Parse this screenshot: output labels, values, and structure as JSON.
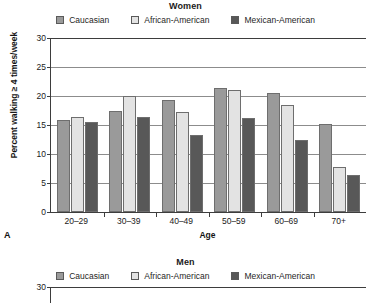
{
  "figure": {
    "panels": [
      {
        "letter": "A",
        "title": "Women",
        "visible": "full"
      },
      {
        "letter": "",
        "title": "Men",
        "visible": "cropped"
      }
    ]
  },
  "legend": {
    "items": [
      {
        "label": "Caucasian",
        "color": "#9a9a9a"
      },
      {
        "label": "African-American",
        "color": "#e3e3e3"
      },
      {
        "label": "Mexican-American",
        "color": "#585858"
      }
    ]
  },
  "axes": {
    "ylabel": "Percent walking ≥ 4 times/week",
    "xlabel": "Age",
    "yticks": [
      "0",
      "5",
      "10",
      "15",
      "20",
      "25",
      "30"
    ]
  },
  "chart_data": [
    {
      "type": "bar",
      "title": "Women",
      "panel_letter": "A",
      "xlabel": "Age",
      "ylabel": "Percent walking ≥ 4 times/week",
      "categories": [
        "20–29",
        "30–39",
        "40–49",
        "50–59",
        "60–69",
        "70+"
      ],
      "ylim": [
        0,
        30
      ],
      "ytick_step": 5,
      "grid": true,
      "legend_position": "top",
      "series": [
        {
          "name": "Caucasian",
          "color": "#9a9a9a",
          "values": [
            15.8,
            17.4,
            19.3,
            21.3,
            20.6,
            15.2
          ]
        },
        {
          "name": "African-American",
          "color": "#e3e3e3",
          "values": [
            16.4,
            20.0,
            17.3,
            21.0,
            18.4,
            7.7
          ]
        },
        {
          "name": "Mexican-American",
          "color": "#585858",
          "values": [
            15.5,
            16.3,
            13.3,
            16.2,
            12.4,
            6.3
          ]
        }
      ]
    },
    {
      "type": "bar",
      "title": "Men",
      "panel_letter": "B",
      "xlabel": "Age",
      "ylabel": "Percent walking ≥ 4 times/week",
      "categories": [],
      "ylim": [
        0,
        30
      ],
      "ytick_step": 5,
      "grid": true,
      "legend_position": "top",
      "note": "Panel cropped at bottom of image; only title, legend and the 30 tick of the y-axis are visible.",
      "series": [
        {
          "name": "Caucasian",
          "color": "#9a9a9a",
          "values": []
        },
        {
          "name": "African-American",
          "color": "#e3e3e3",
          "values": []
        },
        {
          "name": "Mexican-American",
          "color": "#585858",
          "values": []
        }
      ]
    }
  ]
}
